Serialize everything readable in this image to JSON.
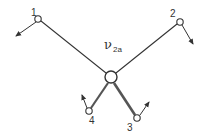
{
  "diagram": {
    "type": "molecular-vibration-mode",
    "mode_label": {
      "symbol": "ν",
      "subscript": "2a"
    },
    "center_atom": {
      "x": 111,
      "y": 77,
      "r": 6
    },
    "atoms": [
      {
        "id": "1",
        "label": "1",
        "x": 38,
        "y": 19,
        "label_x": 31,
        "label_y": 16,
        "arrow": {
          "x2": 16,
          "y2": 36
        }
      },
      {
        "id": "2",
        "label": "2",
        "x": 180,
        "y": 22,
        "label_x": 170,
        "label_y": 17,
        "arrow": {
          "x2": 193,
          "y2": 44
        }
      },
      {
        "id": "3",
        "label": "3",
        "x": 137,
        "y": 118,
        "label_x": 127,
        "label_y": 130,
        "arrow": {
          "x2": 149,
          "y2": 102
        }
      },
      {
        "id": "4",
        "label": "4",
        "x": 89,
        "y": 111,
        "label_x": 89,
        "label_y": 124,
        "arrow": {
          "x2": 82,
          "y2": 95
        }
      }
    ],
    "colors": {
      "stroke": "#333333",
      "bond_heavy": "#555555"
    }
  }
}
